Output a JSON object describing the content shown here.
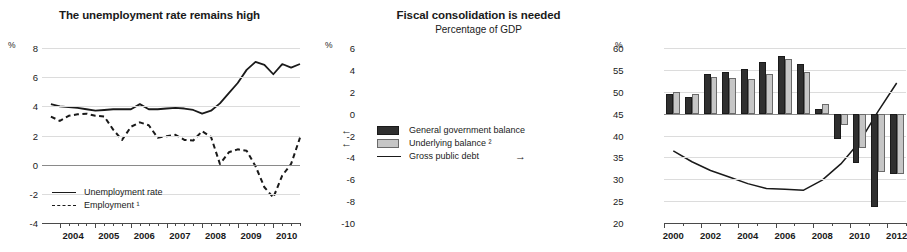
{
  "left_panel": {
    "title": "The unemployment rate remains high",
    "y_unit": "%",
    "y_ticks": [
      "8",
      "6",
      "4",
      "2",
      "0",
      "-2",
      "-4"
    ],
    "x_labels": [
      "2004",
      "2005",
      "2006",
      "2007",
      "2008",
      "2009",
      "2010"
    ],
    "legend": [
      {
        "label": "Unemployment rate",
        "style": "solid-line",
        "color": "#1a1a1a"
      },
      {
        "label": "Employment ¹",
        "style": "dashed-line",
        "color": "#1a1a1a"
      }
    ]
  },
  "right_panel": {
    "title": "Fiscal consolidation is needed",
    "subtitle": "Percentage of GDP",
    "y_unit_left": "%",
    "y_unit_right": "%",
    "y_ticks_left": [
      "6",
      "4",
      "2",
      "0",
      "-2",
      "-4",
      "-6",
      "-8",
      "-10"
    ],
    "y_ticks_right": [
      "60",
      "55",
      "50",
      "45",
      "40",
      "35",
      "30",
      "25",
      "20"
    ],
    "x_labels": [
      "2000",
      "2002",
      "2004",
      "2006",
      "2008",
      "2010",
      "2012"
    ],
    "legend": [
      {
        "label": "General government balance",
        "style": "dark-box",
        "color": "#2f2f2f",
        "axis_arrow": "←"
      },
      {
        "label": "Underlying balance ²",
        "style": "light-box",
        "color": "#c6c6c6",
        "axis_arrow": "←"
      },
      {
        "label": "Gross public debt",
        "style": "solid-line",
        "color": "#1a1a1a",
        "axis_arrow": "→"
      }
    ]
  },
  "chart_data": [
    {
      "type": "line",
      "title": "The unemployment rate remains high",
      "xlabel": "",
      "ylabel": "%",
      "ylim": [
        -4,
        8
      ],
      "xlim": [
        2003.5,
        2010.75
      ],
      "grid": true,
      "legend_position": "bottom-left",
      "x": [
        2003.75,
        2004.0,
        2004.25,
        2004.5,
        2004.75,
        2005.0,
        2005.25,
        2005.5,
        2005.75,
        2006.0,
        2006.25,
        2006.5,
        2006.75,
        2007.0,
        2007.25,
        2007.5,
        2007.75,
        2008.0,
        2008.25,
        2008.5,
        2008.75,
        2009.0,
        2009.25,
        2009.5,
        2009.75,
        2010.0,
        2010.25,
        2010.5,
        2010.75
      ],
      "series": [
        {
          "name": "Unemployment rate",
          "style": "solid",
          "values": [
            4.15,
            4.0,
            3.95,
            3.9,
            3.8,
            3.7,
            3.75,
            3.8,
            3.8,
            3.8,
            4.15,
            3.8,
            3.8,
            3.85,
            3.9,
            3.85,
            3.75,
            3.5,
            3.7,
            4.2,
            4.9,
            5.6,
            6.5,
            7.05,
            6.85,
            6.2,
            6.9,
            6.65,
            6.9
          ]
        },
        {
          "name": "Employment ¹",
          "style": "dashed",
          "values": [
            3.3,
            3.0,
            3.35,
            3.45,
            3.5,
            3.35,
            3.3,
            2.4,
            1.7,
            2.6,
            2.9,
            2.7,
            1.85,
            1.95,
            2.05,
            1.7,
            1.65,
            2.3,
            1.9,
            0.05,
            0.85,
            1.05,
            0.95,
            -0.1,
            -1.55,
            -2.25,
            -0.75,
            0.05,
            1.85
          ]
        }
      ],
      "y_ticks": [
        8,
        6,
        4,
        2,
        0,
        -2,
        -4
      ],
      "x_tick_labels": [
        "2004",
        "2005",
        "2006",
        "2007",
        "2008",
        "2009",
        "2010"
      ]
    },
    {
      "type": "bar",
      "title": "Fiscal consolidation is needed",
      "subtitle": "Percentage of GDP",
      "xlabel": "",
      "ylabel": "%",
      "ylabel_right": "%",
      "ylim": [
        -10,
        6
      ],
      "ylim_right": [
        20,
        60
      ],
      "grid": true,
      "legend_position": "center-left",
      "categories": [
        "2000",
        "2001",
        "2002",
        "2003",
        "2004",
        "2005",
        "2006",
        "2007",
        "2008",
        "2009",
        "2010",
        "2011",
        "2012"
      ],
      "series": [
        {
          "name": "General government balance",
          "kind": "bar",
          "axis": "left",
          "color": "#2f2f2f",
          "values": [
            1.75,
            1.5,
            3.6,
            3.8,
            4.1,
            4.7,
            5.3,
            4.5,
            0.45,
            -2.3,
            -4.5,
            -8.5,
            -5.5
          ]
        },
        {
          "name": "Underlying balance ²",
          "kind": "bar",
          "axis": "left",
          "color": "#c6c6c6",
          "values": [
            1.95,
            1.75,
            3.35,
            3.25,
            3.15,
            3.6,
            5.0,
            3.85,
            0.9,
            -1.0,
            -3.1,
            -5.3,
            -5.5
          ]
        },
        {
          "name": "Gross public debt",
          "kind": "line",
          "axis": "right",
          "color": "#1a1a1a",
          "values": [
            36.5,
            34.0,
            32.0,
            30.5,
            29.0,
            27.9,
            27.7,
            27.5,
            29.8,
            33.5,
            38.5,
            45.5,
            52.0
          ]
        }
      ],
      "y_ticks_left": [
        6,
        4,
        2,
        0,
        -2,
        -4,
        -6,
        -8,
        -10
      ],
      "y_ticks_right": [
        60,
        55,
        50,
        45,
        40,
        35,
        30,
        25,
        20
      ],
      "x_tick_labels": [
        "2000",
        "2002",
        "2004",
        "2006",
        "2008",
        "2010",
        "2012"
      ]
    }
  ]
}
